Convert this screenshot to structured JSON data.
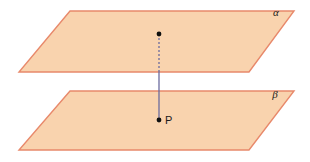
{
  "figure": {
    "background_color": "#ffffff",
    "width": 310,
    "height": 162
  },
  "colors": {
    "plane_fill": "#f9d3ae",
    "plane_stroke": "#e8896b",
    "line_color": "#6b6b9e",
    "point_color": "#101010",
    "label_color": "#1a1a1a"
  },
  "planes": [
    {
      "id": "alpha",
      "label": "α",
      "label_x": 276,
      "label_y": 16,
      "points": "70,11 294,11 249,72 19,72",
      "fill": "#f9d3ae",
      "stroke": "#e8896b",
      "stroke_width": 1.4
    },
    {
      "id": "beta",
      "label": "β",
      "label_x": 275,
      "label_y": 98,
      "points": "70,91 294,91 249,150 19,150",
      "fill": "#f9d3ae",
      "stroke": "#e8896b",
      "stroke_width": 1.4
    }
  ],
  "segments": [
    {
      "id": "dashed-upper-segment",
      "style": "dashed",
      "x1": 159,
      "y1": 34,
      "x2": 159,
      "y2": 72,
      "color": "#6b6b9e",
      "width": 1.3,
      "dash": "2,2"
    },
    {
      "id": "solid-lower-segment",
      "style": "solid",
      "x1": 159,
      "y1": 72,
      "x2": 159,
      "y2": 120,
      "color": "#6b6b9e",
      "width": 1.3,
      "dash": "none"
    }
  ],
  "points": [
    {
      "id": "top-point",
      "label": "",
      "x": 159,
      "y": 34,
      "radius": 2.4,
      "color": "#101010"
    },
    {
      "id": "point-p",
      "label": "P",
      "label_x": 165,
      "label_y": 124,
      "x": 159,
      "y": 120,
      "radius": 2.4,
      "color": "#101010"
    }
  ]
}
